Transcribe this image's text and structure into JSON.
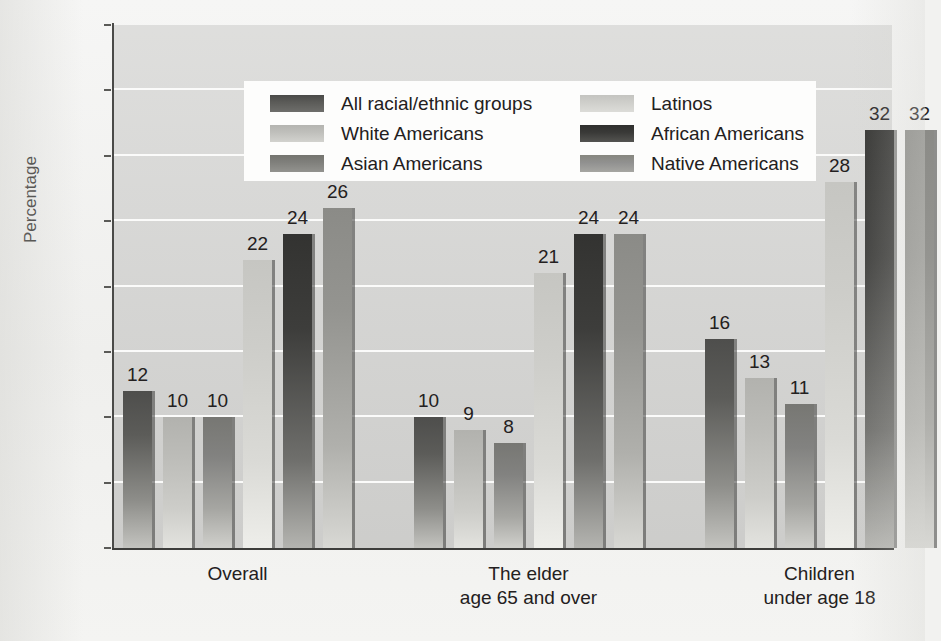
{
  "chart_data": {
    "type": "bar",
    "title": "",
    "xlabel": "",
    "ylabel": "Percentage",
    "ylim": [
      0,
      40
    ],
    "ytick_labels": [
      "0%",
      "5%",
      "10%",
      "15%",
      "20%",
      "25%",
      "30%",
      "35%",
      "40%"
    ],
    "ytick_values": [
      0,
      5,
      10,
      15,
      20,
      25,
      30,
      35,
      40
    ],
    "grid": true,
    "legend_position": "upper-left-inside",
    "categories": [
      "Overall",
      "The elder age 65 and over",
      "Children under age 18"
    ],
    "category_lines": [
      [
        "Overall"
      ],
      [
        "The elder",
        "age 65 and over"
      ],
      [
        "Children",
        "under age 18"
      ]
    ],
    "series": [
      {
        "name": "All racial/ethnic groups",
        "color": "#4e4e4c",
        "values": [
          12,
          10,
          16
        ]
      },
      {
        "name": "White Americans",
        "color": "#b2b2ae",
        "values": [
          10,
          9,
          13
        ]
      },
      {
        "name": "Asian Americans",
        "color": "#777773",
        "values": [
          10,
          8,
          11
        ]
      },
      {
        "name": "Latinos",
        "color": "#c6c6c2",
        "values": [
          22,
          21,
          28
        ]
      },
      {
        "name": "African Americans",
        "color": "#333331",
        "values": [
          24,
          24,
          32
        ]
      },
      {
        "name": "Native Americans",
        "color": "#8b8b87",
        "values": [
          26,
          24,
          32
        ]
      }
    ],
    "bar_labels": [
      [
        "12",
        "10",
        "10",
        "22",
        "24",
        "26"
      ],
      [
        "10",
        "9",
        "8",
        "21",
        "24",
        "24"
      ],
      [
        "16",
        "13",
        "11",
        "28",
        "32",
        "32"
      ]
    ]
  }
}
